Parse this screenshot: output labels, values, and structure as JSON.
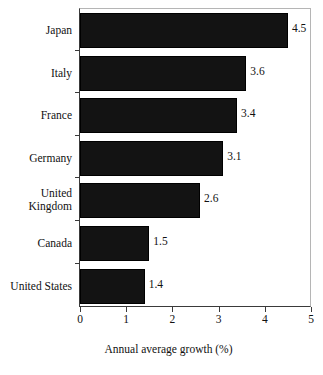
{
  "chart_data": {
    "type": "bar",
    "orientation": "horizontal",
    "title": "",
    "subtitle": "",
    "xlabel": "Annual average growth (%)",
    "ylabel": "",
    "categories": [
      "Japan",
      "Italy",
      "France",
      "Germany",
      "United Kingdom",
      "Canada",
      "United States"
    ],
    "values": [
      4.5,
      3.6,
      3.4,
      3.1,
      2.6,
      1.5,
      1.4
    ],
    "value_labels": [
      "4.5",
      "3.6",
      "3.4",
      "3.1",
      "2.6",
      "1.5",
      "1.4"
    ],
    "xlim": [
      0,
      5
    ],
    "xticks": [
      0,
      1,
      2,
      3,
      4,
      5
    ],
    "xtick_labels": [
      "0",
      "1",
      "2",
      "3",
      "4",
      "5"
    ],
    "grid": false,
    "legend": false,
    "legend_position": "none",
    "bar_color": "#131313",
    "axis_color": "#3a3a3a",
    "text_color": "#111111",
    "background_color": "#ffffff"
  },
  "category_label_lines": [
    [
      "Japan"
    ],
    [
      "Italy"
    ],
    [
      "France"
    ],
    [
      "Germany"
    ],
    [
      "United",
      "Kingdom"
    ],
    [
      "Canada"
    ],
    [
      "United States"
    ]
  ]
}
